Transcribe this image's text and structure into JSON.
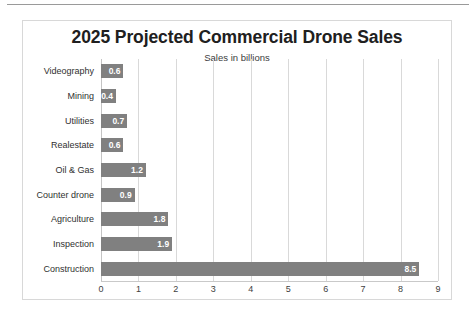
{
  "chart_data": {
    "type": "bar",
    "orientation": "horizontal",
    "title": "2025 Projected Commercial Drone Sales",
    "subtitle": "Sales in billions",
    "xlabel": "",
    "ylabel": "",
    "xlim": [
      0,
      9
    ],
    "xticks": [
      "0",
      "1",
      "2",
      "3",
      "4",
      "5",
      "6",
      "7",
      "8",
      "9"
    ],
    "grid": "vertical",
    "legend": "none",
    "bar_color": "#808080",
    "data_label_color": "#ffffff",
    "categories": [
      "Videography",
      "Mining",
      "Utilities",
      "Realestate",
      "Oil & Gas",
      "Counter drone",
      "Agriculture",
      "Inspection",
      "Construction"
    ],
    "values": [
      0.6,
      0.4,
      0.7,
      0.6,
      1.2,
      0.9,
      1.8,
      1.9,
      8.5
    ],
    "value_labels": [
      "0.6",
      "0.4",
      "0.7",
      "0.6",
      "1.2",
      "0.9",
      "1.8",
      "1.9",
      "8.5"
    ]
  }
}
